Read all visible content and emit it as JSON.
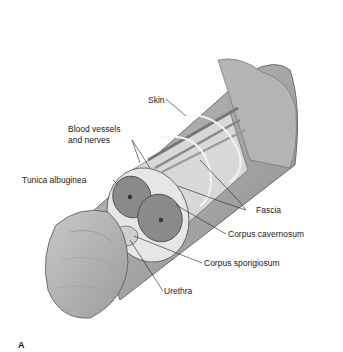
{
  "figure": {
    "panel_label": "A",
    "labels": {
      "skin": "Skin",
      "blood_vessels_line1": "Blood vessels",
      "blood_vessels_line2": "and nerves",
      "tunica_albuginea": "Tunica albuginea",
      "fascia": "Fascia",
      "corpus_cavernosum": "Corpus cavernosum",
      "corpus_spongiosum": "Corpus spongiosum",
      "urethra": "Urethra"
    }
  }
}
